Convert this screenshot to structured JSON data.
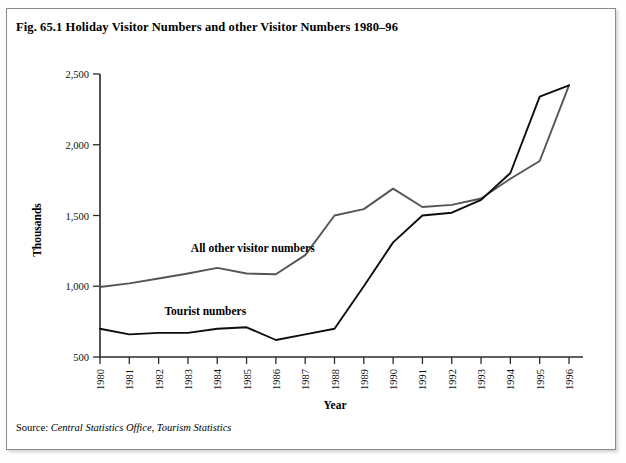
{
  "figure": {
    "title": "Fig. 65.1 Holiday Visitor Numbers and other Visitor Numbers 1980–96",
    "source_label": "Source:",
    "source_text": "Central Statistics Office, Tourism Statistics"
  },
  "chart_data": {
    "type": "line",
    "title": "Fig. 65.1 Holiday Visitor Numbers and other Visitor Numbers 1980–96",
    "xlabel": "Year",
    "ylabel": "Thousands",
    "categories": [
      "1980",
      "1981",
      "1982",
      "1983",
      "1984",
      "1985",
      "1986",
      "1987",
      "1988",
      "1989",
      "1990",
      "1991",
      "1992",
      "1993",
      "1994",
      "1995",
      "1996"
    ],
    "x": [
      1980,
      1981,
      1982,
      1983,
      1984,
      1985,
      1986,
      1987,
      1988,
      1989,
      1990,
      1991,
      1992,
      1993,
      1994,
      1995,
      1996
    ],
    "ylim": [
      500,
      2500
    ],
    "yticks": [
      500,
      1000,
      1500,
      2000,
      2500
    ],
    "ytick_labels": [
      "500",
      "1,000",
      "1,500",
      "2,000",
      "2,500"
    ],
    "grid": false,
    "legend": "inline-annotations",
    "series": [
      {
        "name": "All other visitor numbers",
        "color": "#555555",
        "label_x": 1983.1,
        "label_y": 1245,
        "values": [
          995,
          1020,
          1055,
          1090,
          1130,
          1090,
          1085,
          1220,
          1500,
          1545,
          1690,
          1560,
          1575,
          1620,
          1760,
          1885,
          2420
        ]
      },
      {
        "name": "Tourist numbers",
        "color": "#0d0d0d",
        "label_x": 1982.2,
        "label_y": 800,
        "values": [
          700,
          660,
          670,
          670,
          700,
          710,
          620,
          660,
          700,
          1000,
          1310,
          1500,
          1520,
          1610,
          1800,
          2340,
          2420
        ]
      }
    ],
    "annotations": [
      {
        "text": "All other visitor numbers",
        "series": 0
      },
      {
        "text": "Tourist numbers",
        "series": 1
      }
    ]
  }
}
